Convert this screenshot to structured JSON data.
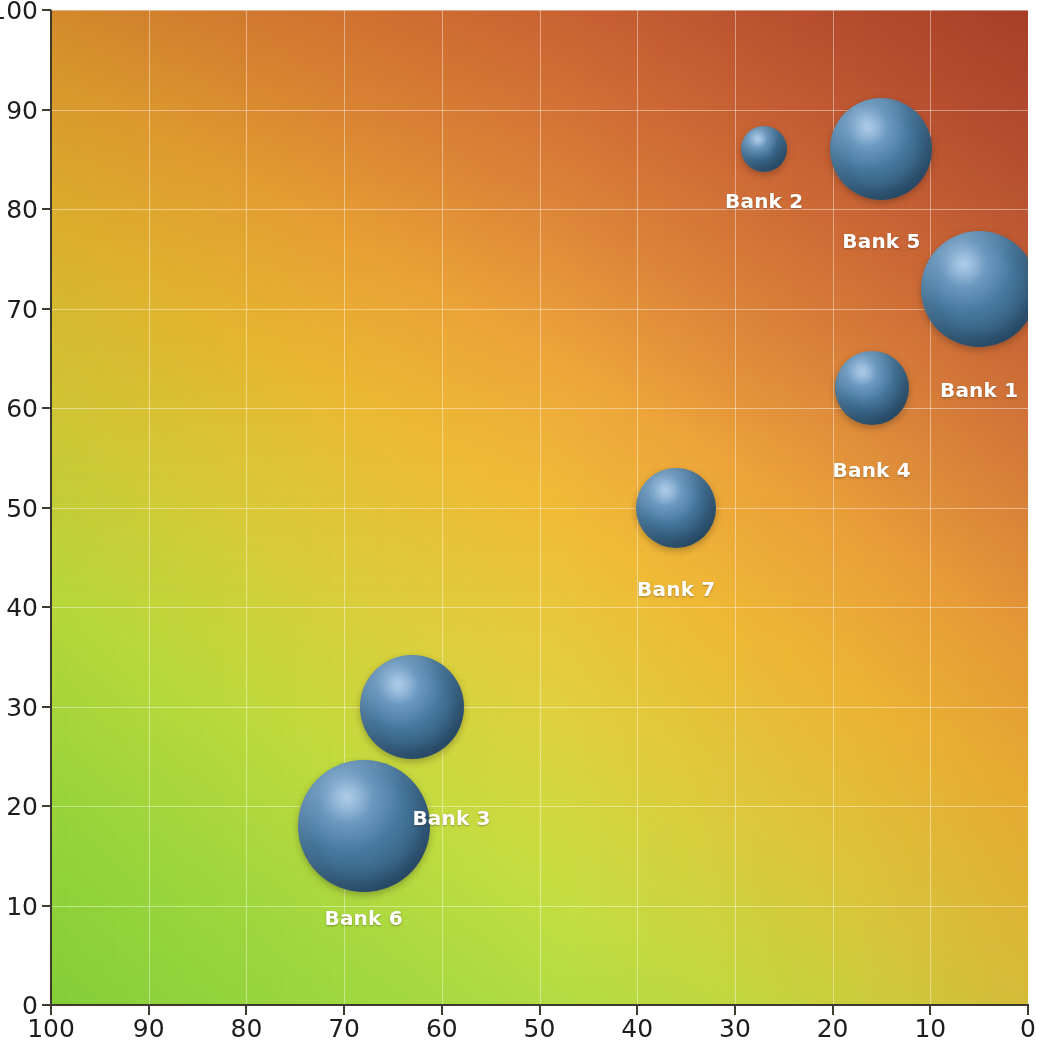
{
  "chart_data": {
    "type": "scatter",
    "title": "",
    "subtitle": "",
    "xlabel": "",
    "ylabel": "",
    "xlim": [
      100,
      0
    ],
    "ylim": [
      0,
      100
    ],
    "x_axis_reversed": true,
    "grid": true,
    "legend_position": "none",
    "x_ticks": [
      100,
      90,
      80,
      70,
      60,
      50,
      40,
      30,
      20,
      10,
      0
    ],
    "y_ticks": [
      0,
      10,
      20,
      30,
      40,
      50,
      60,
      70,
      80,
      90,
      100
    ],
    "bubble_color": "#3D7099",
    "bubble_highlight_color": "#86AED3",
    "label_color": "#FFFFFF",
    "background_gradient": {
      "bottom_left": "#9ED84E",
      "bottom_right": "#D2DC3C",
      "top_left": "#E8A63A",
      "top_right": "#B85B3A"
    },
    "points": [
      {
        "label": "Bank 1",
        "x": 5,
        "y": 72,
        "size": 58,
        "label_x": 5,
        "label_y": 63
      },
      {
        "label": "Bank 2",
        "x": 27,
        "y": 86,
        "size": 23,
        "label_x": 27,
        "label_y": 82
      },
      {
        "label": "Bank 3",
        "x": 63,
        "y": 30,
        "size": 52,
        "label_x": 59,
        "label_y": 20
      },
      {
        "label": "Bank 4",
        "x": 16,
        "y": 62,
        "size": 37,
        "label_x": 16,
        "label_y": 55
      },
      {
        "label": "Bank 5",
        "x": 15,
        "y": 86,
        "size": 51,
        "label_x": 15,
        "label_y": 78
      },
      {
        "label": "Bank 6",
        "x": 68,
        "y": 18,
        "size": 66,
        "label_x": 68,
        "label_y": 10
      },
      {
        "label": "Bank 7",
        "x": 36,
        "y": 50,
        "size": 40,
        "label_x": 36,
        "label_y": 43
      }
    ]
  },
  "axes": {
    "x_tick_labels": [
      "100",
      "90",
      "80",
      "70",
      "60",
      "50",
      "40",
      "30",
      "20",
      "10",
      "0"
    ],
    "y_tick_labels": [
      "0",
      "10",
      "20",
      "30",
      "40",
      "50",
      "60",
      "70",
      "80",
      "90",
      "100"
    ]
  }
}
